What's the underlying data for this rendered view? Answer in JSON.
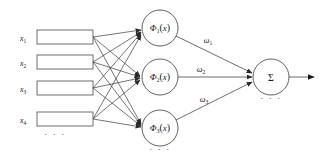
{
  "diagram": {
    "colors": {
      "edge": "#3a3a3a",
      "node_stroke": "#3a3a3a",
      "box_stroke": "#4a4a4a",
      "text": "#1a1a1a",
      "background": "#ffffff"
    },
    "input_layer": {
      "ellipsis": "· · ·",
      "nodes": [
        {
          "label": "x",
          "subscript": "1",
          "value": ""
        },
        {
          "label": "x",
          "subscript": "2",
          "value": ""
        },
        {
          "label": "x",
          "subscript": "3",
          "value": ""
        },
        {
          "label": "x",
          "subscript": "4",
          "value": ""
        }
      ]
    },
    "hidden_layer": {
      "ellipsis": "· · ·",
      "nodes": [
        {
          "fn": "Φ",
          "subscript": "1",
          "arg": "x",
          "open": "(",
          "close": ")"
        },
        {
          "fn": "Φ",
          "subscript": "2",
          "arg": "x",
          "open": "(",
          "close": ")"
        },
        {
          "fn": "Φ",
          "subscript": "3",
          "arg": "x",
          "open": "(",
          "close": ")"
        }
      ]
    },
    "weights": [
      {
        "symbol": "ω",
        "subscript": "1"
      },
      {
        "symbol": "ω",
        "subscript": "2"
      },
      {
        "symbol": "ω",
        "subscript": "3"
      }
    ],
    "output_layer": {
      "symbol": "Σ",
      "ellipsis": "· · ·"
    }
  }
}
